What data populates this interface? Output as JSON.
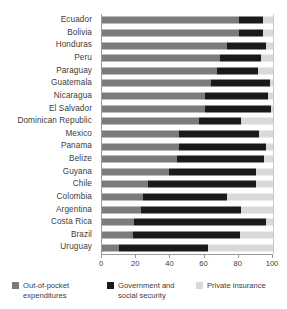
{
  "chart_data": {
    "type": "bar",
    "orientation": "horizontal",
    "stacked": true,
    "title": "",
    "subtitle": "",
    "xlabel": "",
    "ylabel": "",
    "xlim": [
      0,
      100
    ],
    "xticks": [
      0,
      20,
      40,
      60,
      80,
      100
    ],
    "xtick_labels": [
      "0",
      "20",
      "40",
      "60",
      "80",
      "100"
    ],
    "grid": false,
    "legend_position": "bottom",
    "categories": [
      "Ecuador",
      "Bolivia",
      "Honduras",
      "Peru",
      "Paraguay",
      "Guatemala",
      "Nicaragua",
      "El Salvador",
      "Dominican Republic",
      "Mexico",
      "Panama",
      "Belize",
      "Guyana",
      "Chile",
      "Colombia",
      "Argentina",
      "Costa Rica",
      "Brazil",
      "Uruguay"
    ],
    "series": [
      {
        "name": "Out-of-pocket expenditures",
        "color": "#7b7b7b",
        "values": [
          80,
          80,
          73,
          69,
          67,
          64,
          60,
          60,
          57,
          45,
          45,
          44,
          39,
          27,
          24,
          23,
          19,
          18,
          10
        ]
      },
      {
        "name": "Government and social security",
        "color": "#1a1a1a",
        "values": [
          14,
          14,
          23,
          24,
          24,
          34,
          37,
          39,
          24,
          47,
          51,
          51,
          51,
          63,
          49,
          58,
          77,
          63,
          52
        ]
      },
      {
        "name": "Private insurance",
        "color": "#d9d9d9",
        "values": [
          6,
          6,
          4,
          7,
          9,
          2,
          3,
          1,
          19,
          8,
          4,
          5,
          10,
          10,
          27,
          19,
          4,
          19,
          38
        ]
      }
    ]
  },
  "legend": {
    "items": [
      {
        "label_line1": "Out-of-pocket",
        "label_line2": "expenditures",
        "swatch": "oop"
      },
      {
        "label_line1": "Government and",
        "label_line2": "social security",
        "swatch": "gov"
      },
      {
        "label_line1": "Private insurance",
        "label_line2": "",
        "swatch": "priv"
      }
    ]
  },
  "colors": {
    "out_of_pocket": "#7b7b7b",
    "government": "#1a1a1a",
    "private": "#d9d9d9",
    "axis": "#9a9a9a",
    "text": "#3c3c3c",
    "background": "#ffffff"
  }
}
